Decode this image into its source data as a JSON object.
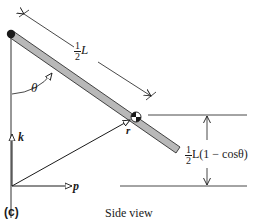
{
  "figure": {
    "panel_label": "(c)",
    "caption": "Side view",
    "rod_length_label": {
      "numerator": "1",
      "denominator": "2",
      "symbol": "L"
    },
    "angle_label": "θ",
    "height_label": {
      "numerator": "1",
      "denominator": "2",
      "expression": "L(1 − cosθ)"
    },
    "vectors": {
      "vertical_axis": "k",
      "horizontal_axis": "p",
      "position_vector": "r"
    },
    "colors": {
      "line": "#1a1a1a",
      "rod_fill": "#b8b8b8",
      "background": "#ffffff"
    }
  }
}
